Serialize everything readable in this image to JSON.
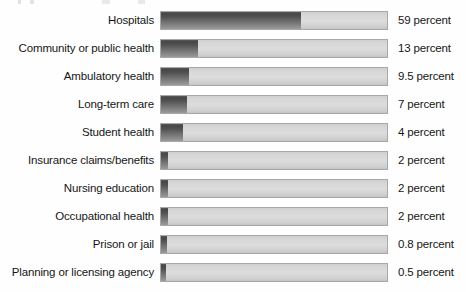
{
  "chart_data": {
    "type": "bar",
    "orientation": "horizontal",
    "title": "",
    "xlabel": "",
    "ylabel": "",
    "grid": false,
    "legend": null,
    "value_suffix": "percent",
    "axis_note": "bar lengths are visually compressed, not linearly proportional",
    "categories": [
      "Hospitals",
      "Community or public health",
      "Ambulatory health",
      "Long-term care",
      "Student health",
      "Insurance claims/benefits",
      "Nursing education",
      "Occupational health",
      "Prison or jail",
      "Planning or licensing agency"
    ],
    "values": [
      59,
      13,
      9.5,
      7,
      4,
      2,
      2,
      2,
      0.8,
      0.5
    ],
    "value_labels": [
      "59 percent",
      "13 percent",
      "9.5 percent",
      "7 percent",
      "4 percent",
      "2 percent",
      "2 percent",
      "2 percent",
      "0.8 percent",
      "0.5 percent"
    ],
    "bar_pixel_widths": [
      140,
      37,
      28,
      26,
      22,
      7,
      7,
      7,
      6,
      5
    ],
    "track_width_px": 228,
    "colors": {
      "bar_fill_dark": "#474747",
      "bar_fill_light": "#9a9a9a",
      "track": "#d8d8d8",
      "track_border": "#a8a8a8",
      "text": "#161616",
      "background": "#fefefe"
    }
  },
  "rows": [
    {
      "label": "Hospitals",
      "value_label": "59 percent",
      "width_px": 140,
      "top_px": 11
    },
    {
      "label": "Community or public health",
      "value_label": "13 percent",
      "width_px": 37,
      "top_px": 39
    },
    {
      "label": "Ambulatory health",
      "value_label": "9.5 percent",
      "width_px": 28,
      "top_px": 67
    },
    {
      "label": "Long-term care",
      "value_label": "7 percent",
      "width_px": 26,
      "top_px": 95
    },
    {
      "label": "Student health",
      "value_label": "4 percent",
      "width_px": 22,
      "top_px": 123
    },
    {
      "label": "Insurance claims/benefits",
      "value_label": "2 percent",
      "width_px": 7,
      "top_px": 151
    },
    {
      "label": "Nursing education",
      "value_label": "2 percent",
      "width_px": 7,
      "top_px": 179
    },
    {
      "label": "Occupational health",
      "value_label": "2 percent",
      "width_px": 7,
      "top_px": 207
    },
    {
      "label": "Prison or jail",
      "value_label": "0.8 percent",
      "width_px": 6,
      "top_px": 235
    },
    {
      "label": "Planning or licensing agency",
      "value_label": "0.5 percent",
      "width_px": 5,
      "top_px": 263
    }
  ]
}
